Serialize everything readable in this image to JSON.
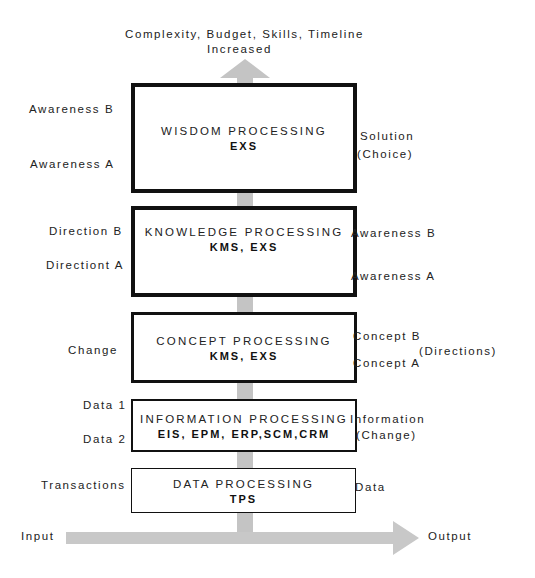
{
  "diagram": {
    "top_caption": {
      "line1": "Complexity, Budget, Skills, Timeline",
      "line2": "Increased"
    },
    "layers": [
      {
        "id": "wisdom",
        "title": "WISDOM PROCESSING",
        "systems": "EXS",
        "left_labels": [
          "Awareness B",
          "Awareness A"
        ],
        "right_labels": [
          "Solution",
          "(Choice)"
        ]
      },
      {
        "id": "knowledge",
        "title": "KNOWLEDGE PROCESSING",
        "systems": "KMS, EXS",
        "left_labels": [
          "Direction B",
          "Directiont A"
        ],
        "right_labels": [
          "Awareness B",
          "Awareness A"
        ]
      },
      {
        "id": "concept",
        "title": "CONCEPT PROCESSING",
        "systems": "KMS, EXS",
        "left_labels": [
          "Change"
        ],
        "right_labels": [
          "Concept B",
          "Concept A",
          "(Directions)"
        ]
      },
      {
        "id": "information",
        "title": "INFORMATION PROCESSING",
        "systems": "EIS, EPM, ERP,SCM,CRM",
        "left_labels": [
          "Data 1",
          "Data 2"
        ],
        "right_labels": [
          "Information",
          "(Change)"
        ]
      },
      {
        "id": "data",
        "title": "DATA PROCESSING",
        "systems": "TPS",
        "left_labels": [
          "Transactions"
        ],
        "right_labels": [
          "Data"
        ]
      }
    ],
    "flow": {
      "input_label": "Input",
      "output_label": "Output"
    },
    "colors": {
      "arrow": "#c4c4c4",
      "border": "#111111",
      "text": "#222222"
    }
  }
}
